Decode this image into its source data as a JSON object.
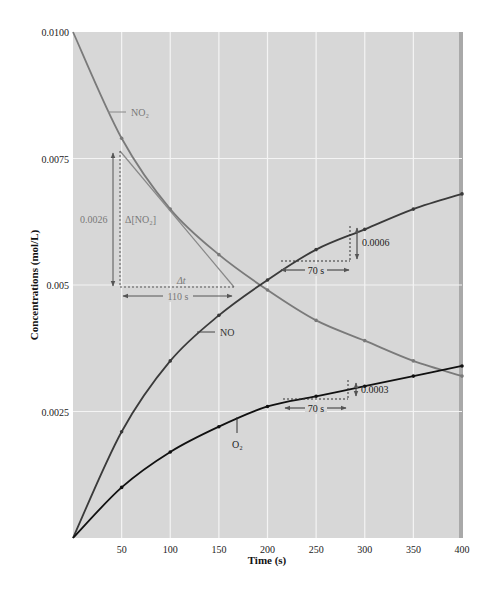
{
  "chart_data": {
    "type": "line",
    "title": "",
    "xlabel": "Time (s)",
    "ylabel": "Concentrations (mol/L)",
    "xlim": [
      0,
      400
    ],
    "ylim": [
      0,
      0.01
    ],
    "x_ticks": [
      50,
      100,
      150,
      200,
      250,
      300,
      350,
      400
    ],
    "y_ticks": [
      0.0025,
      0.005,
      0.0075,
      0.01
    ],
    "y_tick_labels": [
      "0.0025",
      "0.005",
      "0.0075",
      "0.0100"
    ],
    "grid": true,
    "legend": "inline labels",
    "x": [
      0,
      50,
      100,
      150,
      200,
      250,
      300,
      350,
      400
    ],
    "series": [
      {
        "name": "NO2",
        "label": "NO₂",
        "color": "#7a7a7a",
        "values": [
          0.01,
          0.0079,
          0.0065,
          0.0056,
          0.0049,
          0.0043,
          0.0039,
          0.0035,
          0.0032
        ]
      },
      {
        "name": "NO",
        "label": "NO",
        "color": "#3a3a3a",
        "values": [
          0.0,
          0.0021,
          0.0035,
          0.0044,
          0.0051,
          0.0057,
          0.0061,
          0.0065,
          0.0068
        ]
      },
      {
        "name": "O2",
        "label": "O₂",
        "color": "#111111",
        "values": [
          0.0,
          0.001,
          0.0017,
          0.0022,
          0.0026,
          0.0028,
          0.003,
          0.0032,
          0.0034
        ]
      }
    ],
    "annotations": [
      {
        "text": "0.0026",
        "type": "delta-y",
        "series": "NO2"
      },
      {
        "text": "Δ[NO₂]",
        "type": "label"
      },
      {
        "text": "Δt",
        "type": "label"
      },
      {
        "text": "110 s",
        "type": "delta-x",
        "series": "NO2"
      },
      {
        "text": "0.0006",
        "type": "delta-y",
        "series": "NO"
      },
      {
        "text": "70 s",
        "type": "delta-x",
        "series": "NO"
      },
      {
        "text": "0.0003",
        "type": "delta-y",
        "series": "O2"
      },
      {
        "text": "70 s",
        "type": "delta-x",
        "series": "O2"
      }
    ]
  }
}
